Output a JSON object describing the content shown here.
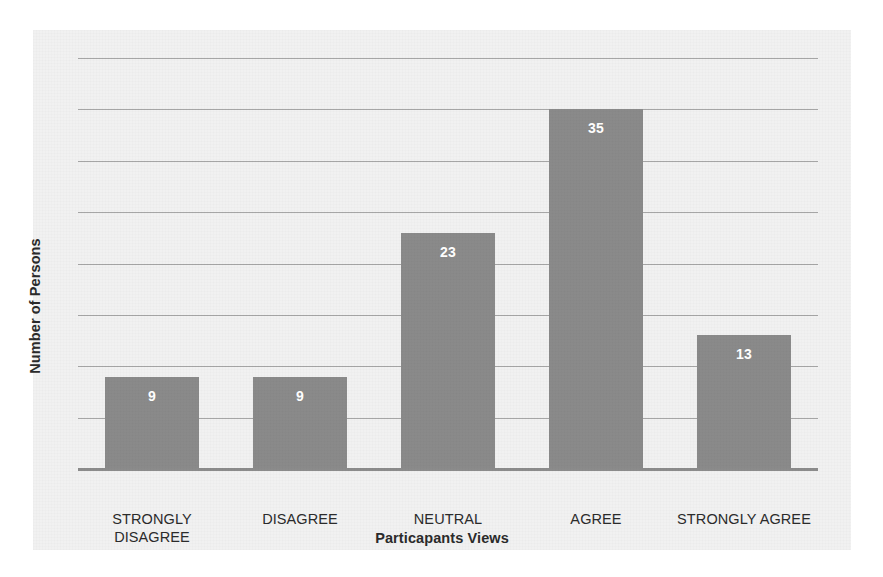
{
  "chart_data": {
    "type": "bar",
    "title": "",
    "xlabel": "Particapants Views",
    "ylabel": "Number of Persons",
    "categories": [
      "STRONGLY DISAGREE",
      "DISAGREE",
      "NEUTRAL",
      "AGREE",
      "STRONGLY AGREE"
    ],
    "category_lines": [
      [
        "STRONGLY",
        "DISAGREE"
      ],
      [
        "DISAGREE"
      ],
      [
        "NEUTRAL"
      ],
      [
        "AGREE"
      ],
      [
        "STRONGLY AGREE"
      ]
    ],
    "values": [
      9,
      9,
      23,
      35,
      13
    ],
    "value_labels": [
      "9",
      "9",
      "23",
      "35",
      "13"
    ],
    "ylim": [
      0,
      40
    ],
    "gridlines": [
      5,
      10,
      15,
      20,
      25,
      30,
      35,
      40
    ],
    "grid": true,
    "tick_labels_visible": false,
    "legend": false,
    "colors": {
      "bar": "#8a8a8a",
      "bar_label": "#ffffff",
      "gridline": "#a6a6a6",
      "axis": "#8c8c8c",
      "plot_background": "#f1f1f1",
      "page_background": "#ffffff",
      "text": "#2b2b2b"
    }
  }
}
